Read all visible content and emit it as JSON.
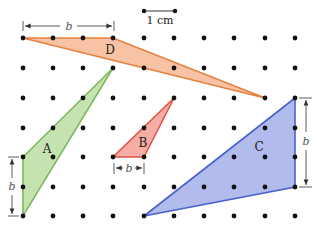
{
  "figure": {
    "scale_bar": {
      "label": "1 cm"
    },
    "dimension_label": "b",
    "shapes": [
      {
        "id": "D",
        "label": "D",
        "fill": "#f6b894",
        "stroke": "#e8803f"
      },
      {
        "id": "A",
        "label": "A",
        "fill": "#bfe0a8",
        "stroke": "#7fb85e"
      },
      {
        "id": "B",
        "label": "B",
        "fill": "#f4a49a",
        "stroke": "#e0554a"
      },
      {
        "id": "C",
        "label": "C",
        "fill": "#a9b4ea",
        "stroke": "#4a63cc"
      }
    ],
    "grid": {
      "columns": 10,
      "rows": 7,
      "dot_color": "#111111"
    }
  }
}
